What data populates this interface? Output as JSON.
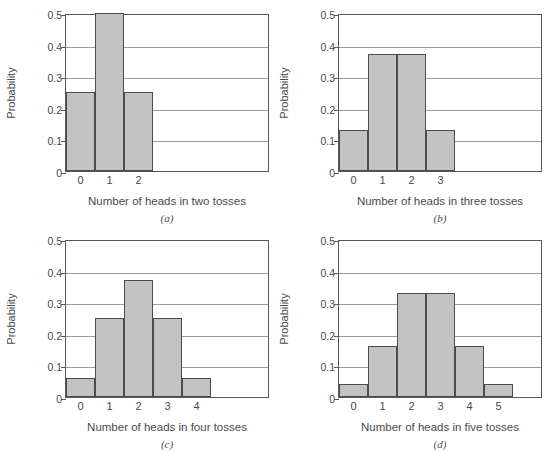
{
  "figure": {
    "background": "#ffffff",
    "bar_fill": "#c3c3c3",
    "bar_stroke": "#4c4c4c",
    "frame_color": "#575757",
    "grid_color": "#9b9b9b",
    "text_color": "#4a4a4a",
    "ylabel": "Probability",
    "yticks": [
      "0",
      "0.1",
      "0.2",
      "0.3",
      "0.4",
      "0.5"
    ],
    "ylim": [
      0,
      0.5
    ]
  },
  "panels": [
    {
      "caption": "(a)",
      "xlabel": "Number of heads in two tosses",
      "ylabel": "Probability",
      "xticks": [
        "0",
        "1",
        "2"
      ],
      "values": [
        0.25,
        0.5,
        0.25
      ]
    },
    {
      "caption": "(b)",
      "xlabel": "Number of heads in three tosses",
      "ylabel": "Probability",
      "xticks": [
        "0",
        "1",
        "2",
        "3"
      ],
      "values": [
        0.13,
        0.37,
        0.37,
        0.13
      ]
    },
    {
      "caption": "(c)",
      "xlabel": "Number of heads in four tosses",
      "ylabel": "Probability",
      "xticks": [
        "0",
        "1",
        "2",
        "3",
        "4"
      ],
      "values": [
        0.06,
        0.25,
        0.37,
        0.25,
        0.06
      ]
    },
    {
      "caption": "(d)",
      "xlabel": "Number of heads in five tosses",
      "ylabel": "Probability",
      "xticks": [
        "0",
        "1",
        "2",
        "3",
        "4",
        "5"
      ],
      "values": [
        0.04,
        0.16,
        0.33,
        0.33,
        0.16,
        0.04
      ]
    }
  ],
  "chart_data": [
    {
      "type": "bar",
      "title": "(a)",
      "categories": [
        "0",
        "1",
        "2"
      ],
      "values": [
        0.25,
        0.5,
        0.25
      ],
      "xlabel": "Number of heads in two tosses",
      "ylabel": "Probability",
      "ylim": [
        0,
        0.5
      ],
      "yticks": [
        0,
        0.1,
        0.2,
        0.3,
        0.4,
        0.5
      ],
      "grid": true,
      "legend": "none"
    },
    {
      "type": "bar",
      "title": "(b)",
      "categories": [
        "0",
        "1",
        "2",
        "3"
      ],
      "values": [
        0.13,
        0.37,
        0.37,
        0.13
      ],
      "xlabel": "Number of heads in three tosses",
      "ylabel": "Probability",
      "ylim": [
        0,
        0.5
      ],
      "yticks": [
        0,
        0.1,
        0.2,
        0.3,
        0.4,
        0.5
      ],
      "grid": true,
      "legend": "none"
    },
    {
      "type": "bar",
      "title": "(c)",
      "categories": [
        "0",
        "1",
        "2",
        "3",
        "4"
      ],
      "values": [
        0.06,
        0.25,
        0.37,
        0.25,
        0.06
      ],
      "xlabel": "Number of heads in four tosses",
      "ylabel": "Probability",
      "ylim": [
        0,
        0.5
      ],
      "yticks": [
        0,
        0.1,
        0.2,
        0.3,
        0.4,
        0.5
      ],
      "grid": true,
      "legend": "none"
    },
    {
      "type": "bar",
      "title": "(d)",
      "categories": [
        "0",
        "1",
        "2",
        "3",
        "4",
        "5"
      ],
      "values": [
        0.04,
        0.16,
        0.33,
        0.33,
        0.16,
        0.04
      ],
      "xlabel": "Number of heads in five tosses",
      "ylabel": "Probability",
      "ylim": [
        0,
        0.5
      ],
      "yticks": [
        0,
        0.1,
        0.2,
        0.3,
        0.4,
        0.5
      ],
      "grid": true,
      "legend": "none"
    }
  ]
}
